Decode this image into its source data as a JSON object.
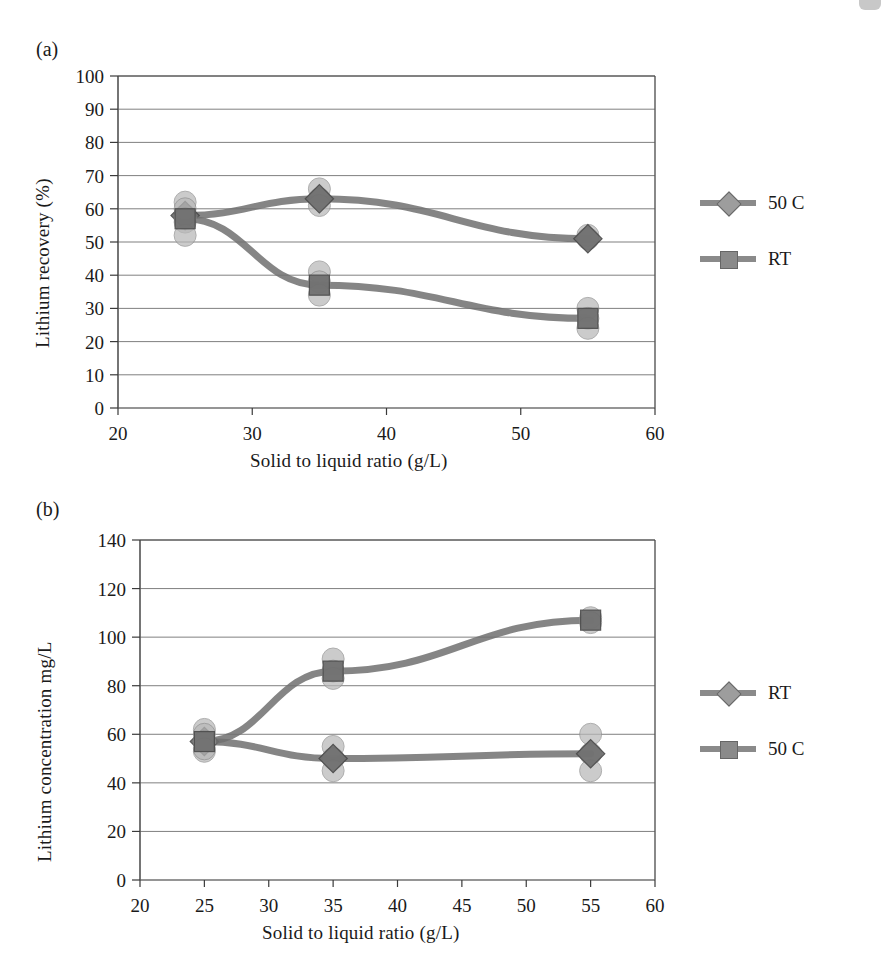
{
  "figure": {
    "panels": [
      {
        "id": "a",
        "label": "(a)",
        "chart_ref": 0
      },
      {
        "id": "b",
        "label": "(b)",
        "chart_ref": 1
      }
    ]
  },
  "colors": {
    "line_dark": "#707070",
    "line_mid": "#8a8a8a",
    "marker_light": "#b8b8b8",
    "marker_dark": "#6e6e6e",
    "gridline": "#5a5a5a",
    "axis": "#3a3a3a",
    "text": "#1a1a1a"
  },
  "chart_data": [
    {
      "type": "scatter",
      "title": "",
      "panel": "(a)",
      "xlabel": "Solid to liquid ratio (g/L)",
      "ylabel": "Lithium recovery (%)",
      "xlim": [
        20,
        60
      ],
      "ylim": [
        0,
        100
      ],
      "xticks": [
        20,
        30,
        40,
        50,
        60
      ],
      "xtick_labels": [
        "20",
        "30",
        "40",
        "50",
        "60"
      ],
      "yticks": [
        0,
        10,
        20,
        30,
        40,
        50,
        60,
        70,
        80,
        90,
        100
      ],
      "ytick_labels": [
        "0",
        "10",
        "20",
        "30",
        "40",
        "50",
        "60",
        "70",
        "80",
        "90",
        "100"
      ],
      "grid": "horizontal",
      "legend_position": "right",
      "series": [
        {
          "name": "50 C",
          "marker": "diamond",
          "color": "#8a8a8a",
          "x": [
            25,
            35,
            55
          ],
          "values": [
            58,
            63,
            51
          ],
          "scatter_points": [
            {
              "x": 25,
              "y": 62
            },
            {
              "x": 25,
              "y": 58
            },
            {
              "x": 25,
              "y": 56
            },
            {
              "x": 35,
              "y": 66
            },
            {
              "x": 35,
              "y": 63
            },
            {
              "x": 35,
              "y": 61
            },
            {
              "x": 55,
              "y": 52
            },
            {
              "x": 55,
              "y": 51
            }
          ]
        },
        {
          "name": "RT",
          "marker": "square",
          "color": "#7a7a7a",
          "x": [
            25,
            35,
            55
          ],
          "values": [
            57,
            37,
            27
          ],
          "scatter_points": [
            {
              "x": 25,
              "y": 60
            },
            {
              "x": 25,
              "y": 57
            },
            {
              "x": 25,
              "y": 52
            },
            {
              "x": 35,
              "y": 41
            },
            {
              "x": 35,
              "y": 38
            },
            {
              "x": 35,
              "y": 34
            },
            {
              "x": 55,
              "y": 30
            },
            {
              "x": 55,
              "y": 27
            },
            {
              "x": 55,
              "y": 24
            }
          ]
        }
      ]
    },
    {
      "type": "scatter",
      "title": "",
      "panel": "(b)",
      "xlabel": "Solid to liquid ratio (g/L)",
      "ylabel": "Lithium concentration mg/L",
      "xlim": [
        20,
        60
      ],
      "ylim": [
        0,
        140
      ],
      "xticks": [
        20,
        25,
        30,
        35,
        40,
        45,
        50,
        55,
        60
      ],
      "xtick_labels": [
        "20",
        "25",
        "30",
        "35",
        "40",
        "45",
        "50",
        "55",
        "60"
      ],
      "yticks": [
        0,
        20,
        40,
        60,
        80,
        100,
        120,
        140
      ],
      "ytick_labels": [
        "0",
        "20",
        "40",
        "60",
        "80",
        "100",
        "120",
        "140"
      ],
      "grid": "horizontal",
      "legend_position": "right",
      "series": [
        {
          "name": "RT",
          "marker": "diamond",
          "color": "#8a8a8a",
          "x": [
            25,
            35,
            55
          ],
          "values": [
            57,
            50,
            52
          ],
          "scatter_points": [
            {
              "x": 25,
              "y": 62
            },
            {
              "x": 25,
              "y": 57
            },
            {
              "x": 25,
              "y": 53
            },
            {
              "x": 35,
              "y": 55
            },
            {
              "x": 35,
              "y": 50
            },
            {
              "x": 35,
              "y": 45
            },
            {
              "x": 55,
              "y": 60
            },
            {
              "x": 55,
              "y": 52
            },
            {
              "x": 55,
              "y": 45
            }
          ]
        },
        {
          "name": "50 C",
          "marker": "square",
          "color": "#7a7a7a",
          "x": [
            25,
            35,
            55
          ],
          "values": [
            57,
            86,
            107
          ],
          "scatter_points": [
            {
              "x": 25,
              "y": 60
            },
            {
              "x": 25,
              "y": 57
            },
            {
              "x": 25,
              "y": 54
            },
            {
              "x": 35,
              "y": 91
            },
            {
              "x": 35,
              "y": 86
            },
            {
              "x": 35,
              "y": 83
            },
            {
              "x": 55,
              "y": 108
            },
            {
              "x": 55,
              "y": 106
            }
          ]
        }
      ]
    }
  ]
}
